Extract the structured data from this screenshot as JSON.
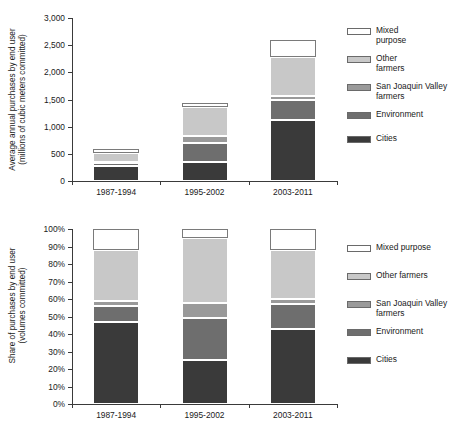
{
  "figure": {
    "categories": [
      "1987-1994",
      "1995-2002",
      "2003-2011"
    ],
    "series_names": [
      "Cities",
      "Environment",
      "San Joaquin Valley farmers",
      "Other farmers",
      "Mixed purpose"
    ],
    "colors": {
      "cities": "#3a3a3a",
      "environment": "#6e6e6e",
      "san_joaquin_valley_farmers": "#9a9a9a",
      "other_farmers": "#c8c8c8",
      "mixed_purpose": "#ffffff",
      "axis": "#3a3a3a",
      "swatch_border": "#6a6a6a"
    }
  },
  "chart_data": [
    {
      "type": "bar",
      "stacked": true,
      "panel": "top",
      "title": "",
      "xlabel": "",
      "ylabel": "Average annual purchases by end user (millions of cubic meters committed)",
      "ylabel_line1": "Average annual purchases by end user",
      "ylabel_line2": "(millions of cubic meters committed)",
      "categories": [
        "1987-1994",
        "1995-2002",
        "2003-2011"
      ],
      "ylim": [
        0,
        3000
      ],
      "yticks": [
        0,
        500,
        1000,
        1500,
        2000,
        2500,
        3000
      ],
      "ytick_labels": [
        "0",
        "500",
        "1,000",
        "1,500",
        "2,000",
        "2,500",
        "3,000"
      ],
      "grid": false,
      "legend_position": "right",
      "units": "millions of cubic meters committed",
      "series": [
        {
          "name": "Cities",
          "values": [
            280,
            350,
            1120
          ]
        },
        {
          "name": "Environment",
          "values": [
            50,
            345,
            365
          ]
        },
        {
          "name": "San Joaquin Valley farmers",
          "values": [
            20,
            125,
            80
          ]
        },
        {
          "name": "Other farmers",
          "values": [
            170,
            535,
            725
          ]
        },
        {
          "name": "Mixed purpose",
          "values": [
            70,
            75,
            310
          ]
        }
      ],
      "totals": [
        590,
        1430,
        2600
      ]
    },
    {
      "type": "bar",
      "stacked": true,
      "normalized": true,
      "panel": "bottom",
      "title": "",
      "xlabel": "",
      "ylabel": "Share of purchases by end user (volumes committed)",
      "ylabel_line1": "Share of purchases by end user",
      "ylabel_line2": "(volumes committed)",
      "categories": [
        "1987-1994",
        "1995-2002",
        "2003-2011"
      ],
      "ylim": [
        0,
        100
      ],
      "yticks": [
        0,
        10,
        20,
        30,
        40,
        50,
        60,
        70,
        80,
        90,
        100
      ],
      "ytick_labels": [
        "0%",
        "10%",
        "20%",
        "30%",
        "40%",
        "50%",
        "60%",
        "70%",
        "80%",
        "90%",
        "100%"
      ],
      "grid": false,
      "legend_position": "right",
      "units": "percent of volumes committed",
      "series": [
        {
          "name": "Cities",
          "values": [
            47,
            25,
            43
          ]
        },
        {
          "name": "Environment",
          "values": [
            9,
            24,
            14
          ]
        },
        {
          "name": "San Joaquin Valley farmers",
          "values": [
            3,
            9,
            3
          ]
        },
        {
          "name": "Other farmers",
          "values": [
            29,
            37,
            28
          ]
        },
        {
          "name": "Mixed purpose",
          "values": [
            12,
            5,
            12
          ]
        }
      ],
      "totals": [
        100,
        100,
        100
      ]
    }
  ],
  "legend_top": {
    "items": [
      {
        "label": "Mixed\npurpose",
        "color": "#ffffff"
      },
      {
        "label": "Other\nfarmers",
        "color": "#c8c8c8"
      },
      {
        "label": "San Joaquin Valley\nfarmers",
        "color": "#9a9a9a"
      },
      {
        "label": "Environment",
        "color": "#6e6e6e"
      },
      {
        "label": "Cities",
        "color": "#3a3a3a"
      }
    ]
  },
  "legend_bottom": {
    "items": [
      {
        "label": "Mixed purpose",
        "color": "#ffffff"
      },
      {
        "label": "Other farmers",
        "color": "#c8c8c8"
      },
      {
        "label": "San Joaquin Valley\nfarmers",
        "color": "#9a9a9a"
      },
      {
        "label": "Environment",
        "color": "#6e6e6e"
      },
      {
        "label": "Cities",
        "color": "#3a3a3a"
      }
    ]
  }
}
